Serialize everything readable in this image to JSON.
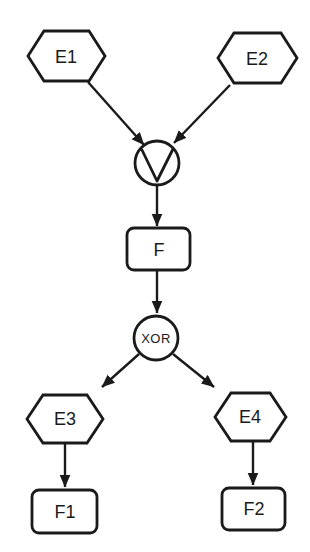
{
  "diagram": {
    "colors": {
      "background": "#ffffff",
      "line": "#1a1a1a"
    },
    "nodes": {
      "e1": {
        "label": "E1",
        "shape": "hexagon"
      },
      "e2": {
        "label": "E2",
        "shape": "hexagon"
      },
      "or_gate": {
        "label": "∨",
        "shape": "circle",
        "symbol": "logical-or"
      },
      "f": {
        "label": "F",
        "shape": "rounded-rectangle"
      },
      "xor_gate": {
        "label": "XOR",
        "shape": "circle"
      },
      "e3": {
        "label": "E3",
        "shape": "hexagon"
      },
      "e4": {
        "label": "E4",
        "shape": "hexagon"
      },
      "f1": {
        "label": "F1",
        "shape": "rounded-rectangle"
      },
      "f2": {
        "label": "F2",
        "shape": "rounded-rectangle"
      }
    },
    "edges": [
      {
        "from": "E1",
        "to": "∨"
      },
      {
        "from": "E2",
        "to": "∨"
      },
      {
        "from": "∨",
        "to": "F"
      },
      {
        "from": "F",
        "to": "XOR"
      },
      {
        "from": "XOR",
        "to": "E3"
      },
      {
        "from": "XOR",
        "to": "E4"
      },
      {
        "from": "E3",
        "to": "F1"
      },
      {
        "from": "E4",
        "to": "F2"
      }
    ]
  }
}
